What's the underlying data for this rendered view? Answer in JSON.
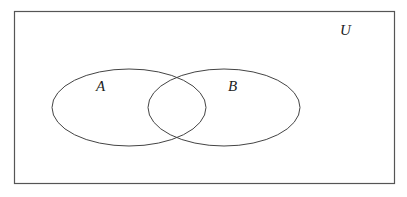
{
  "diagram": {
    "type": "venn",
    "universe_label": "U",
    "sets": [
      {
        "label": "A"
      },
      {
        "label": "B"
      }
    ],
    "colors": {
      "stroke": "#444444",
      "background": "#ffffff"
    }
  }
}
